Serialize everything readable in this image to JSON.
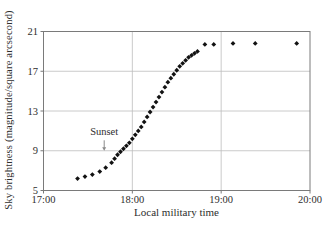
{
  "figure": {
    "background": "#ffffff",
    "axis_color": "#7a7a7a",
    "grid_color": "#bdbdbd",
    "marker_color": "#121212",
    "text_color": "#2e2e2e",
    "arrow_color": "#8a8a8a"
  },
  "chart_data": {
    "type": "scatter",
    "title": "",
    "xlabel": "Local military time",
    "ylabel": "Sky brightness (magnitude/square arcsecond)",
    "x_ticks": [
      "17:00",
      "18:00",
      "19:00",
      "20:00"
    ],
    "y_ticks": [
      5,
      9,
      13,
      17,
      21
    ],
    "xlim": [
      "17:00",
      "20:00"
    ],
    "ylim": [
      5,
      21
    ],
    "grid": true,
    "legend_position": "none",
    "marker": "diamond",
    "points": [
      [
        "17:23",
        6.2
      ],
      [
        "17:28",
        6.4
      ],
      [
        "17:33",
        6.6
      ],
      [
        "17:38",
        6.9
      ],
      [
        "17:42",
        7.3
      ],
      [
        "17:46",
        7.8
      ],
      [
        "17:48",
        8.2
      ],
      [
        "17:50",
        8.6
      ],
      [
        "17:52",
        8.9
      ],
      [
        "17:54",
        9.2
      ],
      [
        "17:56",
        9.5
      ],
      [
        "17:58",
        9.8
      ],
      [
        "18:00",
        10.2
      ],
      [
        "18:02",
        10.6
      ],
      [
        "18:04",
        11.0
      ],
      [
        "18:06",
        11.4
      ],
      [
        "18:08",
        11.9
      ],
      [
        "18:10",
        12.4
      ],
      [
        "18:12",
        12.9
      ],
      [
        "18:14",
        13.4
      ],
      [
        "18:16",
        13.9
      ],
      [
        "18:18",
        14.4
      ],
      [
        "18:20",
        14.9
      ],
      [
        "18:22",
        15.4
      ],
      [
        "18:24",
        15.9
      ],
      [
        "18:26",
        16.3
      ],
      [
        "18:28",
        16.7
      ],
      [
        "18:30",
        17.1
      ],
      [
        "18:32",
        17.5
      ],
      [
        "18:34",
        17.8
      ],
      [
        "18:36",
        18.1
      ],
      [
        "18:38",
        18.4
      ],
      [
        "18:40",
        18.6
      ],
      [
        "18:42",
        18.8
      ],
      [
        "18:44",
        19.0
      ],
      [
        "18:49",
        19.7
      ],
      [
        "18:55",
        19.7
      ],
      [
        "19:08",
        19.8
      ],
      [
        "19:23",
        19.8
      ],
      [
        "19:51",
        19.8
      ]
    ],
    "annotation": {
      "label": "Sunset",
      "time": "17:41",
      "label_value": 10.6,
      "arrow_from_value": 10.05,
      "arrow_to_value": 9.0
    }
  }
}
